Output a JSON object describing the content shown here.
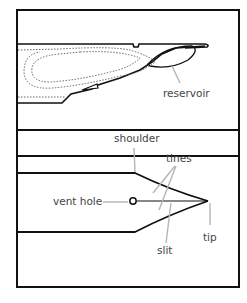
{
  "diagram": {
    "top_panel": {
      "labels": {
        "reservoir": "reservoir"
      }
    },
    "bottom_panel": {
      "labels": {
        "shoulder": "shoulder",
        "tines": "tines",
        "vent_hole": "vent hole",
        "slit": "slit",
        "tip": "tip"
      }
    },
    "colors": {
      "outline": "#111111",
      "leader": "#b5b5b5",
      "text": "#444444",
      "dotted": "#666666"
    }
  }
}
